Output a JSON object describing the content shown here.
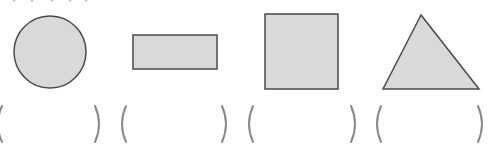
{
  "diagram": {
    "title": "",
    "colors": {
      "shape_fill": "#d9d9d9",
      "shape_stroke": "#4a4a4a",
      "paren_stroke": "#8a8a8a"
    },
    "shapes": [
      {
        "name": "circle",
        "answer": ""
      },
      {
        "name": "rectangle",
        "answer": ""
      },
      {
        "name": "square",
        "answer": ""
      },
      {
        "name": "triangle",
        "answer": ""
      }
    ]
  }
}
